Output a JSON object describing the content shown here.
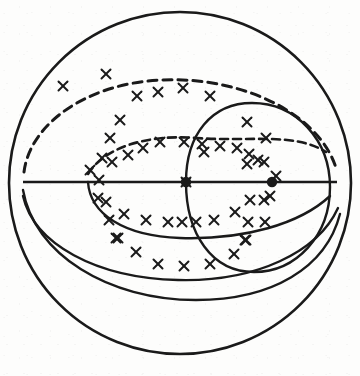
{
  "figure": {
    "name": "sphere-great-circle-projection",
    "background_color": "#fdfdfc",
    "stroke_color": "#1a1a1a"
  },
  "chart_data": {
    "type": "scatter",
    "title": "",
    "xlabel": "",
    "ylabel": "",
    "projection": "orthographic-sphere",
    "xlim": [
      0,
      360
    ],
    "ylim": [
      0,
      376
    ],
    "grid": false,
    "legend": null,
    "outline": {
      "name": "sphere-outline",
      "shape": "circle",
      "cx": 180,
      "cy": 183,
      "r": 171,
      "stroke_width": 2.6,
      "style": "solid"
    },
    "equator": {
      "name": "equator-line",
      "x1": 23,
      "y1": 182,
      "x2": 337,
      "y2": 182,
      "stroke_width": 2.6,
      "style": "solid"
    },
    "nodes": [
      {
        "name": "ascending-node",
        "cx": 186,
        "cy": 182,
        "r": 5.2
      },
      {
        "name": "descending-node",
        "cx": 272,
        "cy": 182,
        "r": 5.2
      }
    ],
    "curves": [
      {
        "name": "inner-great-circle",
        "style": "solid",
        "stroke_width": 2.4,
        "path": "M 186 182 C 186 134 212 103 252 103 C 296 103 330 140 330 187 C 330 236 296 272 254 272 C 212 272 186 234 186 182 Z"
      },
      {
        "name": "upper-dashed-great-circle-outer",
        "style": "dashed",
        "stroke_width": 3.0,
        "dash": "9,6",
        "path": "M 24 172 C 30 124 86 84 160 80 C 246 76 320 116 336 168"
      },
      {
        "name": "upper-dashed-great-circle-inner",
        "style": "dashed",
        "stroke_width": 2.6,
        "dash": "8,5",
        "path": "M 88 174 C 104 148 146 134 196 138 C 250 142 294 132 326 152"
      },
      {
        "name": "lower-solid-arc-shallow",
        "style": "solid",
        "stroke_width": 2.4,
        "path": "M 88 182 C 90 214 124 236 180 238 C 244 240 300 224 330 196"
      },
      {
        "name": "lower-solid-arc-mid",
        "style": "solid",
        "stroke_width": 2.4,
        "path": "M 23 196 C 34 244 96 278 178 280 C 256 282 318 252 338 208"
      },
      {
        "name": "lower-solid-arc-deep",
        "style": "solid",
        "stroke_width": 2.4,
        "path": "M 23 190 C 34 254 108 300 196 300 C 272 300 326 268 340 214"
      }
    ],
    "points": [
      {
        "x": 63,
        "y": 86
      },
      {
        "x": 106,
        "y": 74
      },
      {
        "x": 137,
        "y": 96
      },
      {
        "x": 158,
        "y": 92
      },
      {
        "x": 183,
        "y": 88
      },
      {
        "x": 210,
        "y": 96
      },
      {
        "x": 120,
        "y": 120
      },
      {
        "x": 110,
        "y": 138
      },
      {
        "x": 160,
        "y": 142
      },
      {
        "x": 184,
        "y": 142
      },
      {
        "x": 202,
        "y": 144
      },
      {
        "x": 247,
        "y": 122
      },
      {
        "x": 266,
        "y": 138
      },
      {
        "x": 204,
        "y": 152
      },
      {
        "x": 220,
        "y": 146
      },
      {
        "x": 237,
        "y": 148
      },
      {
        "x": 249,
        "y": 154
      },
      {
        "x": 102,
        "y": 158
      },
      {
        "x": 112,
        "y": 162
      },
      {
        "x": 128,
        "y": 155
      },
      {
        "x": 143,
        "y": 148
      },
      {
        "x": 258,
        "y": 160
      },
      {
        "x": 247,
        "y": 164
      },
      {
        "x": 264,
        "y": 162
      },
      {
        "x": 186,
        "y": 182
      },
      {
        "x": 99,
        "y": 180
      },
      {
        "x": 98,
        "y": 198
      },
      {
        "x": 106,
        "y": 202
      },
      {
        "x": 124,
        "y": 214
      },
      {
        "x": 146,
        "y": 220
      },
      {
        "x": 168,
        "y": 222
      },
      {
        "x": 182,
        "y": 222
      },
      {
        "x": 196,
        "y": 222
      },
      {
        "x": 214,
        "y": 220
      },
      {
        "x": 235,
        "y": 212
      },
      {
        "x": 250,
        "y": 200
      },
      {
        "x": 264,
        "y": 200
      },
      {
        "x": 270,
        "y": 196
      },
      {
        "x": 109,
        "y": 220
      },
      {
        "x": 116,
        "y": 238
      },
      {
        "x": 248,
        "y": 222
      },
      {
        "x": 245,
        "y": 240
      },
      {
        "x": 136,
        "y": 252
      },
      {
        "x": 265,
        "y": 222
      },
      {
        "x": 118,
        "y": 238
      },
      {
        "x": 158,
        "y": 264
      },
      {
        "x": 184,
        "y": 266
      },
      {
        "x": 210,
        "y": 264
      },
      {
        "x": 234,
        "y": 254
      },
      {
        "x": 246,
        "y": 240
      },
      {
        "x": 90,
        "y": 170
      },
      {
        "x": 276,
        "y": 176
      }
    ],
    "point_marker": {
      "name": "cross-marker",
      "glyph": "x",
      "size": 9,
      "stroke_width": 2.0
    },
    "point_count": 52
  }
}
